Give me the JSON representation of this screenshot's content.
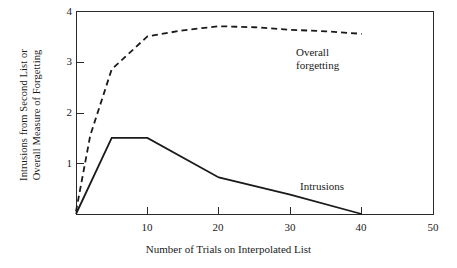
{
  "chart_data": {
    "type": "line",
    "title": "",
    "subtitle": "",
    "xlabel": "Number of Trials on Interpolated List",
    "ylabel_line1": "Intrusions from Second List or",
    "ylabel_line2": "Overall Measure of Forgetting",
    "xlim": [
      0,
      50
    ],
    "ylim": [
      0,
      4
    ],
    "xticks": [
      10,
      20,
      30,
      40,
      50
    ],
    "xticklabels": [
      "10",
      "20",
      "30",
      "40",
      "50"
    ],
    "yticks": [
      1,
      2,
      3,
      4
    ],
    "yticklabels": [
      "1",
      "2",
      "3",
      "4"
    ],
    "grid": false,
    "legend_position": "inline-annotation",
    "series": [
      {
        "name": "Overall forgetting",
        "style": "dashed",
        "color": "#1a1a1a",
        "label_text": "Overall\nforgetting",
        "label_line1": "Overall",
        "label_line2": "forgetting",
        "x": [
          0,
          2,
          5,
          10,
          15,
          20,
          25,
          30,
          35,
          40
        ],
        "y": [
          0.05,
          1.55,
          2.85,
          3.5,
          3.62,
          3.7,
          3.68,
          3.63,
          3.6,
          3.55
        ]
      },
      {
        "name": "Intrusions",
        "style": "solid",
        "color": "#1a1a1a",
        "label_text": "Intrusions",
        "x": [
          0,
          5,
          10,
          20,
          30,
          40
        ],
        "y": [
          0.0,
          1.5,
          1.5,
          0.72,
          0.38,
          0.0
        ]
      }
    ]
  },
  "annotations": {
    "overall_label_line1": "Overall",
    "overall_label_line2": "forgetting",
    "intrusions_label": "Intrusions"
  }
}
